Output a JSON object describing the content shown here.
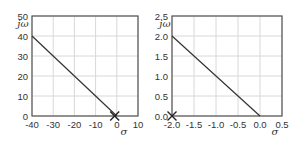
{
  "chart_data": [
    {
      "type": "line",
      "title": "",
      "xlabel": "σ",
      "ylabel": "jω",
      "xlim": [
        -40,
        10
      ],
      "ylim": [
        0,
        50
      ],
      "xticks": [
        -40,
        -30,
        -20,
        -10,
        0,
        10
      ],
      "xtick_labels": [
        "-40",
        "-30",
        "-20",
        "-10",
        "0",
        "10"
      ],
      "yticks": [
        0,
        10,
        20,
        30,
        40,
        50
      ],
      "ytick_labels": [
        "0",
        "10",
        "20",
        "30",
        "40",
        "50"
      ],
      "grid": true,
      "series": [
        {
          "name": "root-locus",
          "x": [
            -40,
            0
          ],
          "y": [
            40,
            0
          ]
        }
      ],
      "markers": [
        {
          "symbol": "x",
          "x": -1,
          "y": 0
        }
      ]
    },
    {
      "type": "line",
      "title": "",
      "xlabel": "σ",
      "ylabel": "jω",
      "xlim": [
        -2.0,
        0.5
      ],
      "ylim": [
        0,
        2.5
      ],
      "xticks": [
        -2.0,
        -1.5,
        -1.0,
        -0.5,
        0.0,
        0.5
      ],
      "xtick_labels": [
        "-2.0",
        "-1.5",
        "-1.0",
        "-0.5",
        "0.0",
        "0.5"
      ],
      "yticks": [
        0.0,
        0.5,
        1.0,
        1.5,
        2.0,
        2.5
      ],
      "ytick_labels": [
        "0.0",
        "0.5",
        "1.0",
        "1.5",
        "2.0",
        "2.5"
      ],
      "grid": true,
      "series": [
        {
          "name": "root-locus",
          "x": [
            -2.0,
            0.0
          ],
          "y": [
            2.0,
            0.0
          ]
        }
      ],
      "markers": [
        {
          "symbol": "x",
          "x": -2.0,
          "y": 0
        }
      ]
    }
  ],
  "colors": {
    "frame": "#555555",
    "grid": "#d8d8d8",
    "line": "#333333"
  }
}
